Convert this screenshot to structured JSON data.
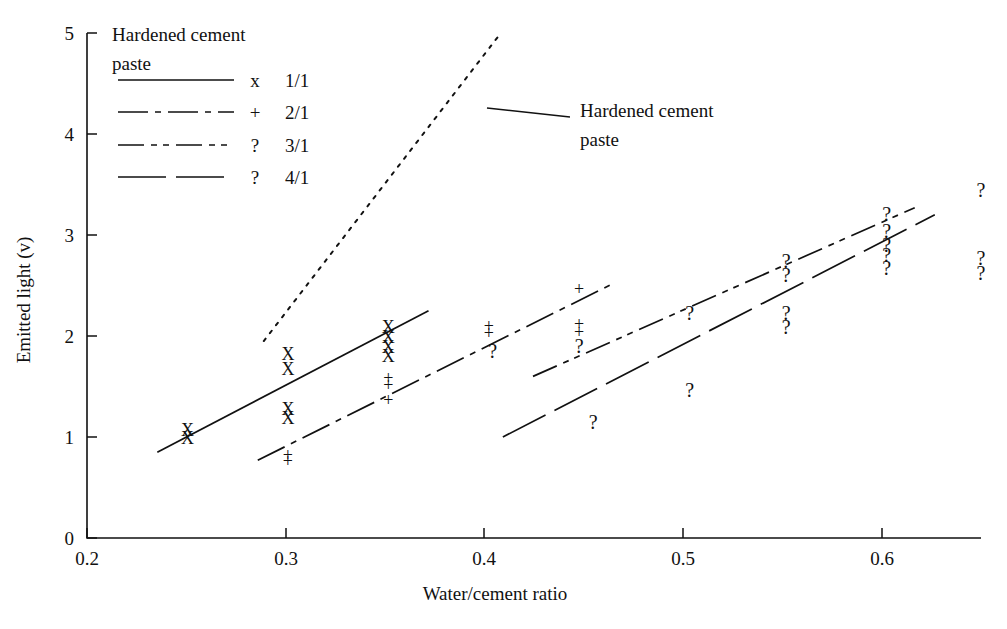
{
  "chart_data": {
    "type": "scatter",
    "title": "",
    "xlabel": "Water/cement ratio",
    "ylabel": "Emitted light (v)",
    "xlim": [
      0.2,
      0.645
    ],
    "ylim": [
      0,
      5
    ],
    "xticks": [
      "0.2",
      "0.3",
      "0.4",
      "0.5",
      "0.6"
    ],
    "xtick_values": [
      0.2,
      0.3,
      0.4,
      0.5,
      0.6
    ],
    "yticks": [
      "0",
      "1",
      "2",
      "3",
      "4",
      "5"
    ],
    "ytick_values": [
      0,
      1,
      2,
      3,
      4,
      5
    ],
    "grid": false,
    "legend_position": "top-left",
    "legend_title": "Hardened cement paste",
    "series": [
      {
        "name": "1/1",
        "marker": "x",
        "linestyle": "solid",
        "points": [
          {
            "x": 0.25,
            "y": 1.05
          },
          {
            "x": 0.25,
            "y": 0.97
          },
          {
            "x": 0.3,
            "y": 1.8
          },
          {
            "x": 0.3,
            "y": 1.65
          },
          {
            "x": 0.3,
            "y": 1.26
          },
          {
            "x": 0.3,
            "y": 1.17
          },
          {
            "x": 0.35,
            "y": 2.07
          },
          {
            "x": 0.35,
            "y": 1.97
          },
          {
            "x": 0.35,
            "y": 1.87
          },
          {
            "x": 0.35,
            "y": 1.78
          }
        ],
        "fit_line": {
          "x0": 0.235,
          "y0": 0.85,
          "x1": 0.37,
          "y1": 2.25
        }
      },
      {
        "name": "2/1",
        "marker": "+",
        "linestyle": "dash-dot",
        "points": [
          {
            "x": 0.3,
            "y": 0.8
          },
          {
            "x": 0.3,
            "y": 0.74
          },
          {
            "x": 0.35,
            "y": 1.57
          },
          {
            "x": 0.35,
            "y": 1.5
          },
          {
            "x": 0.35,
            "y": 1.35
          },
          {
            "x": 0.4,
            "y": 2.08
          },
          {
            "x": 0.4,
            "y": 2.01
          },
          {
            "x": 0.445,
            "y": 2.45
          },
          {
            "x": 0.445,
            "y": 2.1
          },
          {
            "x": 0.445,
            "y": 2.02
          }
        ],
        "fit_line": {
          "x0": 0.285,
          "y0": 0.77,
          "x1": 0.462,
          "y1": 2.52
        }
      },
      {
        "name": "3/1",
        "marker": "?",
        "linestyle": "dash-dot-dot",
        "points": [
          {
            "x": 0.402,
            "y": 1.83
          },
          {
            "x": 0.445,
            "y": 1.88
          },
          {
            "x": 0.5,
            "y": 2.2
          },
          {
            "x": 0.548,
            "y": 2.72
          },
          {
            "x": 0.548,
            "y": 2.58
          },
          {
            "x": 0.598,
            "y": 3.18
          },
          {
            "x": 0.598,
            "y": 3.02
          },
          {
            "x": 0.598,
            "y": 2.88
          },
          {
            "x": 0.645,
            "y": 3.42
          }
        ],
        "fit_line": {
          "x0": 0.422,
          "y0": 1.6,
          "x1": 0.612,
          "y1": 3.27
        }
      },
      {
        "name": "4/1",
        "marker": "?",
        "linestyle": "long-dash",
        "points": [
          {
            "x": 0.5,
            "y": 1.44
          },
          {
            "x": 0.452,
            "y": 1.12
          },
          {
            "x": 0.548,
            "y": 2.2
          },
          {
            "x": 0.548,
            "y": 2.07
          },
          {
            "x": 0.598,
            "y": 2.78
          },
          {
            "x": 0.598,
            "y": 2.65
          },
          {
            "x": 0.645,
            "y": 2.75
          },
          {
            "x": 0.645,
            "y": 2.6
          }
        ],
        "fit_line": {
          "x0": 0.407,
          "y0": 1.0,
          "x1": 0.622,
          "y1": 3.2
        }
      },
      {
        "name": "Hardened cement paste",
        "marker": "none",
        "linestyle": "dotted",
        "points": [],
        "fit_line": {
          "x0": 0.288,
          "y0": 1.95,
          "x1": 0.406,
          "y1": 5.0
        }
      }
    ],
    "annotations": [
      {
        "text": "Hardened cement",
        "x": 0.418,
        "y": 4.35
      },
      {
        "text": "paste",
        "x": 0.418,
        "y": 4.0
      }
    ]
  },
  "axes": {
    "x_title": "Water/cement ratio",
    "y_title": "Emitted light (v)",
    "x_tick_labels": [
      "0.2",
      "0.3",
      "0.4",
      "0.5",
      "0.6"
    ],
    "y_tick_labels": [
      "0",
      "1",
      "2",
      "3",
      "4",
      "5"
    ]
  },
  "legend": {
    "title_line1": "Hardened cement",
    "title_line2": "paste",
    "entries": [
      {
        "style": "solid",
        "marker": "x",
        "label": "1/1"
      },
      {
        "style": "dash-dot",
        "marker": "+",
        "label": "2/1"
      },
      {
        "style": "dash-dot-dot",
        "marker": "?",
        "label": "3/1"
      },
      {
        "style": "long-dash",
        "marker": "?",
        "label": "4/1"
      }
    ]
  },
  "annotation": {
    "line1": "Hardened cement",
    "line2": "paste"
  },
  "colors": {
    "ink": "#111111",
    "background": "#ffffff"
  }
}
